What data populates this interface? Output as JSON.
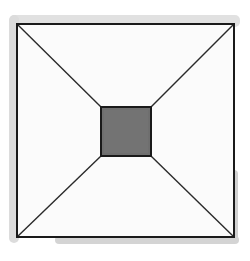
{
  "diagram": {
    "title": "",
    "outer_square": {
      "x1": 17,
      "y1": 24,
      "x2": 234,
      "y2": 237
    },
    "inner_square": {
      "x1": 101,
      "y1": 107,
      "x2": 151,
      "y2": 156
    },
    "colors": {
      "background": "#ffffff",
      "paper": "#fafafa",
      "stroke": "#1e1e1e",
      "inner_fill": "#6e6e6e",
      "shadow": "#cfcfcf"
    }
  }
}
